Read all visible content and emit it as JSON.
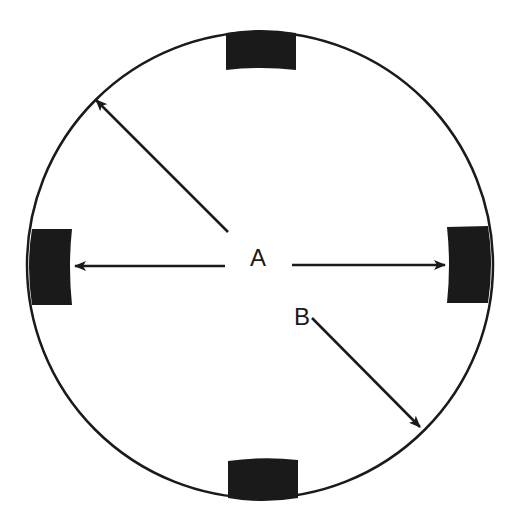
{
  "diagram": {
    "type": "circle-with-four-blocks",
    "circle": {
      "cx": 260,
      "cy": 265,
      "r": 233,
      "stroke": "#1a1a1a"
    },
    "blocks": [
      {
        "name": "top-block",
        "x": 226,
        "y": 30,
        "w": 70,
        "h": 40
      },
      {
        "name": "left-block",
        "x": 28,
        "y": 229,
        "w": 44,
        "h": 76
      },
      {
        "name": "right-block",
        "x": 447,
        "y": 226,
        "w": 45,
        "h": 77
      },
      {
        "name": "bottom-block",
        "x": 228,
        "y": 458,
        "w": 70,
        "h": 46
      }
    ],
    "labels": {
      "A": "A",
      "B": "B"
    },
    "arrows": [
      {
        "name": "arrow-a-upper-left",
        "from": [
          228,
          232
        ],
        "to": [
          96,
          100
        ]
      },
      {
        "name": "arrow-a-left",
        "from": [
          225,
          266
        ],
        "to": [
          75,
          266
        ]
      },
      {
        "name": "arrow-a-right",
        "from": [
          292,
          265
        ],
        "to": [
          445,
          265
        ]
      },
      {
        "name": "arrow-b-lower-right",
        "from": [
          312,
          318
        ],
        "to": [
          420,
          427
        ]
      }
    ],
    "colors": {
      "ink": "#1a1a1a",
      "background": "#ffffff"
    }
  }
}
